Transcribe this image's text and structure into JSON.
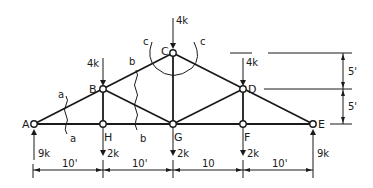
{
  "diagram": {
    "type": "roof-truss",
    "nodes": {
      "A": {
        "label": "A"
      },
      "B": {
        "label": "B"
      },
      "C": {
        "label": "C"
      },
      "D": {
        "label": "D"
      },
      "E": {
        "label": "E"
      },
      "F": {
        "label": "F"
      },
      "G": {
        "label": "G"
      },
      "H": {
        "label": "H"
      }
    },
    "loads": {
      "B": "4k",
      "C": "4k",
      "D": "4k",
      "H": "2k",
      "G": "2k",
      "F": "2k"
    },
    "reactions": {
      "A": "9k",
      "E": "9k"
    },
    "spans": [
      "10'",
      "10'",
      "10",
      "10'"
    ],
    "heights": [
      "5'",
      "5'"
    ],
    "sections": {
      "a_top": "a",
      "a_bottom": "a",
      "b_top": "b",
      "b_bottom": "b",
      "c_left": "c",
      "c_right": "c"
    }
  }
}
